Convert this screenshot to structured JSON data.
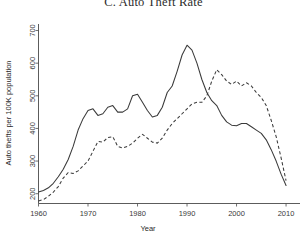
{
  "chart_data": {
    "type": "line",
    "title": "C. Auto Theft Rate",
    "xlabel": "Year",
    "ylabel": "Auto thefts per 100K population",
    "xlim": [
      1960,
      2011
    ],
    "ylim": [
      170,
      720
    ],
    "xticks": [
      1960,
      1970,
      1980,
      1990,
      2000,
      2010
    ],
    "yticks": [
      200,
      300,
      400,
      500,
      600,
      700
    ],
    "grid": false,
    "legend": "none",
    "x": [
      1960,
      1961,
      1962,
      1963,
      1964,
      1965,
      1966,
      1967,
      1968,
      1969,
      1970,
      1971,
      1972,
      1973,
      1974,
      1975,
      1976,
      1977,
      1978,
      1979,
      1980,
      1981,
      1982,
      1983,
      1984,
      1985,
      1986,
      1987,
      1988,
      1989,
      1990,
      1991,
      1992,
      1993,
      1994,
      1995,
      1996,
      1997,
      1998,
      1999,
      2000,
      2001,
      2002,
      2003,
      2004,
      2005,
      2006,
      2007,
      2008,
      2009,
      2010
    ],
    "series": [
      {
        "name": "solid-line",
        "style": "solid",
        "values": [
          205,
          210,
          218,
          232,
          252,
          275,
          305,
          345,
          395,
          430,
          455,
          460,
          440,
          445,
          465,
          470,
          450,
          450,
          460,
          500,
          505,
          480,
          455,
          435,
          440,
          465,
          510,
          530,
          575,
          625,
          655,
          640,
          600,
          550,
          510,
          485,
          470,
          440,
          420,
          410,
          408,
          415,
          415,
          405,
          395,
          385,
          365,
          335,
          300,
          260,
          225
        ]
      },
      {
        "name": "dashed-line",
        "style": "dashed",
        "values": [
          178,
          182,
          192,
          205,
          222,
          248,
          265,
          262,
          270,
          285,
          300,
          330,
          360,
          358,
          372,
          375,
          345,
          340,
          345,
          355,
          370,
          382,
          370,
          358,
          355,
          370,
          395,
          415,
          430,
          445,
          460,
          475,
          480,
          480,
          500,
          545,
          580,
          565,
          545,
          535,
          545,
          530,
          540,
          530,
          510,
          495,
          470,
          425,
          375,
          310,
          240
        ]
      }
    ]
  },
  "labels": {
    "xticks": [
      "1960",
      "1970",
      "1980",
      "1990",
      "2000",
      "2010"
    ],
    "yticks": [
      "200",
      "300",
      "400",
      "500",
      "600",
      "700"
    ]
  }
}
